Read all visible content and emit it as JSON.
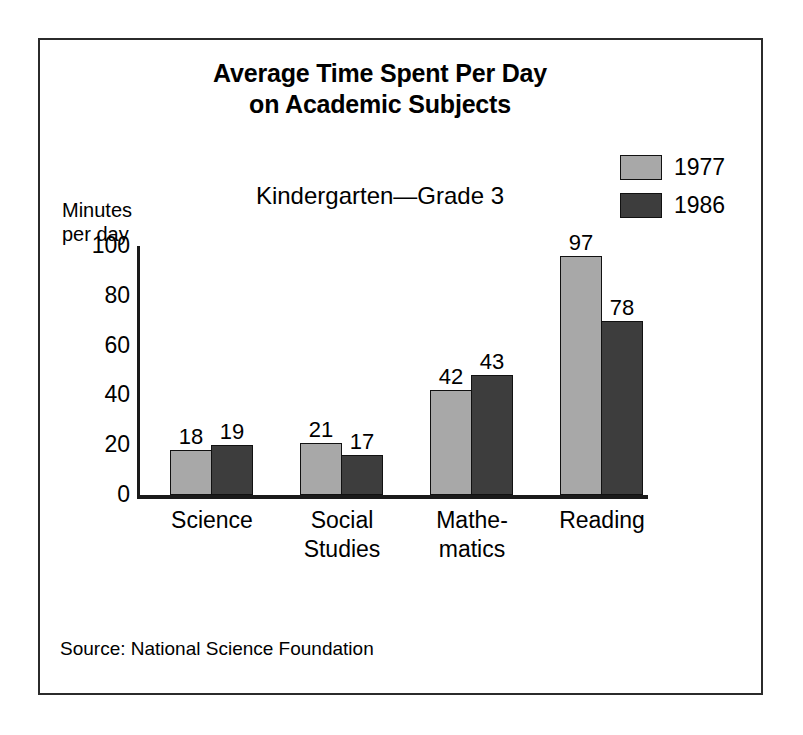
{
  "chart_data": {
    "type": "bar",
    "title": "Average Time Spent Per Day on Academic Subjects",
    "title_lines": [
      "Average Time Spent Per Day",
      "on Academic Subjects"
    ],
    "subtitle": "Kindergarten—Grade 3",
    "xlabel": "",
    "ylabel": "Minutes per day",
    "ylabel_lines": [
      "Minutes",
      "per day"
    ],
    "ylim": [
      0,
      100
    ],
    "ytick_labels": [
      "100",
      "80",
      "60",
      "40",
      "20",
      "0"
    ],
    "yticks": [
      100,
      80,
      60,
      40,
      20,
      0
    ],
    "grid": false,
    "legend_position": "top-right",
    "categories": [
      "Science",
      "Social Studies",
      "Mathematics",
      "Reading"
    ],
    "category_label_lines": [
      [
        "Science"
      ],
      [
        "Social",
        "Studies"
      ],
      [
        "Mathe-",
        "matics"
      ],
      [
        "Reading"
      ]
    ],
    "series": [
      {
        "name": "1977",
        "color": "#a8a8a8",
        "values": [
          18,
          21,
          42,
          97
        ]
      },
      {
        "name": "1986",
        "color": "#3d3d3d",
        "values": [
          19,
          17,
          43,
          78
        ]
      }
    ],
    "bar_plot_heights": [
      [
        18,
        21,
        42,
        96
      ],
      [
        20,
        16,
        48,
        70
      ]
    ],
    "source": "Source: National Science Foundation"
  },
  "legend": {
    "entries": [
      {
        "label": "1977",
        "color": "#a8a8a8"
      },
      {
        "label": "1986",
        "color": "#3d3d3d"
      }
    ]
  },
  "colors": {
    "series_1977": "#a8a8a8",
    "series_1986": "#3d3d3d",
    "frame": "#2b2b2b",
    "axis": "#1a1a1a",
    "background": "#ffffff",
    "text": "#000000"
  }
}
